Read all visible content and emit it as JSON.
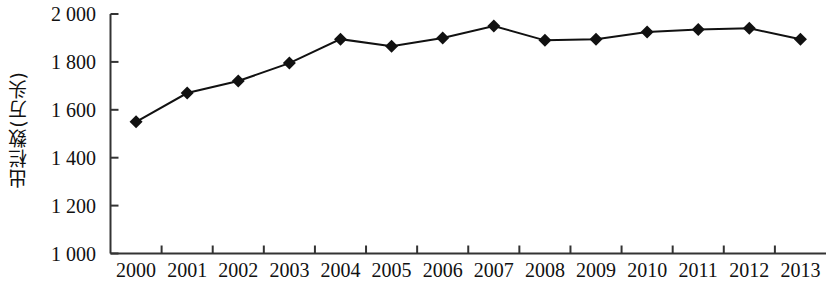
{
  "chart_data": {
    "type": "line",
    "title": "",
    "xlabel": "",
    "ylabel": "出栏数(万头)",
    "categories": [
      "2000",
      "2001",
      "2002",
      "2003",
      "2004",
      "2005",
      "2006",
      "2007",
      "2008",
      "2009",
      "2010",
      "2011",
      "2012",
      "2013"
    ],
    "values": [
      1550,
      1670,
      1720,
      1795,
      1895,
      1865,
      1900,
      1950,
      1890,
      1895,
      1925,
      1935,
      1940,
      1895
    ],
    "series": [
      {
        "name": "出栏数",
        "values": [
          1550,
          1670,
          1720,
          1795,
          1895,
          1865,
          1900,
          1950,
          1890,
          1895,
          1925,
          1935,
          1940,
          1895
        ]
      }
    ],
    "ylim": [
      1000,
      2000
    ],
    "ytick_labels": [
      "2 000",
      "1 800",
      "1 600",
      "1 400",
      "1 200",
      "1 000"
    ],
    "ytick_values": [
      2000,
      1800,
      1600,
      1400,
      1200,
      1000
    ],
    "grid": false,
    "legend": "none",
    "marker": "diamond",
    "line_color": "#111111",
    "marker_color": "#111111",
    "axis_color": "#333333"
  }
}
